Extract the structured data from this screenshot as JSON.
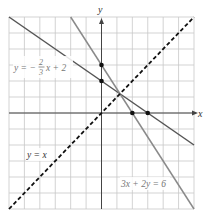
{
  "chart_data": {
    "type": "line",
    "title": "",
    "xlabel": "x",
    "ylabel": "y",
    "xlim": [
      -6,
      6
    ],
    "ylim": [
      -6,
      6
    ],
    "grid": true,
    "grid_step": 1,
    "series": [
      {
        "name": "y = -2/3 x + 2",
        "equation": "y = -(2/3)x + 2",
        "style": "solid",
        "color": "#555555",
        "points": [
          [
            -6,
            6
          ],
          [
            6,
            -2
          ]
        ]
      },
      {
        "name": "3x + 2y = 6",
        "equation": "3x + 2y = 6",
        "style": "solid",
        "color": "#8a8a8a",
        "points": [
          [
            -2,
            6
          ],
          [
            6,
            -6
          ]
        ]
      },
      {
        "name": "y = x",
        "equation": "y = x",
        "style": "dashed",
        "color": "#111111",
        "points": [
          [
            -6,
            -6
          ],
          [
            6,
            6
          ]
        ]
      }
    ],
    "marked_points": [
      [
        0,
        3
      ],
      [
        0,
        2
      ],
      [
        2,
        0
      ],
      [
        3,
        0
      ]
    ],
    "intersection": [
      1.2,
      1.2
    ],
    "annotations": [
      {
        "text_parts": [
          "y = −",
          "2",
          "3",
          "x + 2"
        ],
        "near": "upper-left"
      },
      {
        "text": "y = x",
        "near": "lower-left"
      },
      {
        "text": "3x + 2y = 6",
        "near": "lower-right"
      }
    ]
  },
  "labels": {
    "x_axis": "x",
    "y_axis": "y",
    "eq1_prefix": "y = −",
    "eq1_num": "2",
    "eq1_den": "3",
    "eq1_suffix": "x + 2",
    "eq2": "3x + 2y = 6",
    "eq3": "y = x"
  }
}
